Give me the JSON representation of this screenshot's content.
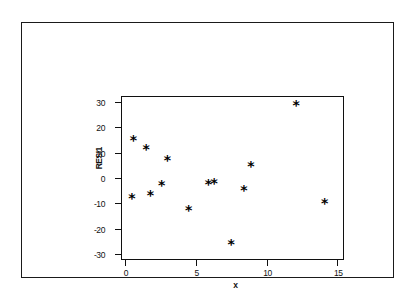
{
  "figure": {
    "border_color": "#1a1a1a",
    "background": "#ffffff",
    "marker_symbol": "*",
    "marker_color": "#000000"
  },
  "chart_data": {
    "type": "scatter",
    "title": "",
    "subtitle": "",
    "xlabel": "x",
    "ylabel": "RESI1",
    "xlim": [
      -0.2,
      15.4
    ],
    "ylim": [
      -32,
      32
    ],
    "xticks": [
      0,
      5,
      10,
      15
    ],
    "xtick_labels": [
      "0",
      "5",
      "10",
      "15"
    ],
    "yticks": [
      30,
      20,
      10,
      0,
      -10,
      -20,
      -30
    ],
    "ytick_labels": [
      "30",
      "20",
      "10",
      "0",
      "-10",
      "-20",
      "-30"
    ],
    "grid": false,
    "legend": false,
    "legend_position": "none",
    "series": [
      {
        "name": "RESI1",
        "marker": "*",
        "points": [
          {
            "x": 0.5,
            "y": -7.5
          },
          {
            "x": 0.6,
            "y": 15.5
          },
          {
            "x": 1.5,
            "y": 12.0
          },
          {
            "x": 1.8,
            "y": -6.2
          },
          {
            "x": 2.6,
            "y": -2.5
          },
          {
            "x": 3.0,
            "y": 7.5
          },
          {
            "x": 4.5,
            "y": -12.2
          },
          {
            "x": 5.9,
            "y": -2.0
          },
          {
            "x": 6.3,
            "y": -1.5
          },
          {
            "x": 7.5,
            "y": -25.8
          },
          {
            "x": 8.4,
            "y": -4.5
          },
          {
            "x": 8.9,
            "y": 5.2
          },
          {
            "x": 12.1,
            "y": 29.3
          },
          {
            "x": 14.1,
            "y": -9.3
          }
        ]
      }
    ]
  }
}
